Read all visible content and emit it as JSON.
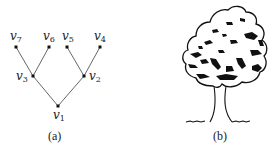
{
  "panel_a": {
    "caption": "(a)",
    "nodes": [
      {
        "id": "v1",
        "name": "v",
        "sub": "1",
        "x": 58,
        "y": 106
      },
      {
        "id": "v2",
        "name": "v",
        "sub": "2",
        "x": 84,
        "y": 76
      },
      {
        "id": "v3",
        "name": "v",
        "sub": "3",
        "x": 33,
        "y": 76
      },
      {
        "id": "v4",
        "name": "v",
        "sub": "4",
        "x": 100,
        "y": 47
      },
      {
        "id": "v5",
        "name": "v",
        "sub": "5",
        "x": 67,
        "y": 47
      },
      {
        "id": "v6",
        "name": "v",
        "sub": "6",
        "x": 49,
        "y": 47
      },
      {
        "id": "v7",
        "name": "v",
        "sub": "7",
        "x": 16,
        "y": 47
      }
    ],
    "edges": [
      [
        "v1",
        "v2"
      ],
      [
        "v1",
        "v3"
      ],
      [
        "v3",
        "v7"
      ],
      [
        "v3",
        "v6"
      ],
      [
        "v2",
        "v5"
      ],
      [
        "v2",
        "v4"
      ]
    ]
  },
  "panel_b": {
    "caption": "(b)",
    "image": "tree-illustration-icon"
  }
}
